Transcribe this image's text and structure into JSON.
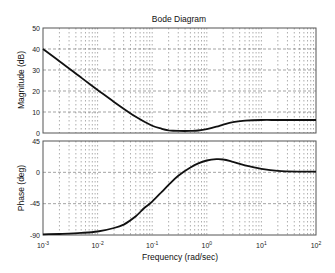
{
  "chart_data": [
    {
      "type": "line",
      "panel": "magnitude",
      "title": "Bode Diagram",
      "xlabel": "Frequency (rad/sec)",
      "ylabel": "Magnitude (dB)",
      "xscale": "log",
      "xlim": [
        0.001,
        100
      ],
      "ylim": [
        0,
        50
      ],
      "yticks": [
        0,
        10,
        20,
        30,
        40,
        50
      ],
      "ytick_labels": [
        "0",
        "10",
        "20",
        "30",
        "40",
        "50"
      ],
      "grid": true,
      "series": [
        {
          "name": "magnitude",
          "x": [
            0.001,
            0.002,
            0.005,
            0.01,
            0.02,
            0.05,
            0.1,
            0.15,
            0.2,
            0.3,
            0.5,
            0.7,
            1,
            1.5,
            2,
            3,
            5,
            10,
            20,
            50,
            100
          ],
          "values": [
            40,
            34.2,
            26.4,
            20.5,
            14.8,
            7.7,
            3.5,
            2.0,
            1.3,
            1.0,
            1.0,
            1.2,
            1.8,
            3.0,
            4.0,
            5.2,
            5.9,
            6.2,
            6.2,
            6.2,
            6.2
          ]
        }
      ]
    },
    {
      "type": "line",
      "panel": "phase",
      "xlabel": "Frequency (rad/sec)",
      "ylabel": "Phase (deg)",
      "xscale": "log",
      "xlim": [
        0.001,
        100
      ],
      "ylim": [
        -90,
        45
      ],
      "yticks": [
        -90,
        -45,
        0,
        45
      ],
      "ytick_labels": [
        "-90",
        "-45",
        "0",
        "45"
      ],
      "xticks": [
        0.001,
        0.01,
        0.1,
        1,
        10,
        100
      ],
      "xtick_labels": [
        {
          "base": "10",
          "exp": "-3"
        },
        {
          "base": "10",
          "exp": "-2"
        },
        {
          "base": "10",
          "exp": "-1"
        },
        {
          "base": "10",
          "exp": "0"
        },
        {
          "base": "10",
          "exp": "1"
        },
        {
          "base": "10",
          "exp": "2"
        }
      ],
      "grid": true,
      "series": [
        {
          "name": "phase",
          "x": [
            0.001,
            0.002,
            0.005,
            0.01,
            0.02,
            0.03,
            0.05,
            0.07,
            0.1,
            0.15,
            0.2,
            0.3,
            0.5,
            0.7,
            1,
            1.5,
            2,
            3,
            5,
            10,
            20,
            50,
            100
          ],
          "values": [
            -89,
            -88.5,
            -87,
            -85,
            -80,
            -75,
            -63,
            -52,
            -42,
            -28,
            -18,
            -5,
            7,
            13,
            17,
            19,
            18.5,
            15,
            10,
            5,
            2,
            1,
            1
          ]
        }
      ]
    }
  ]
}
